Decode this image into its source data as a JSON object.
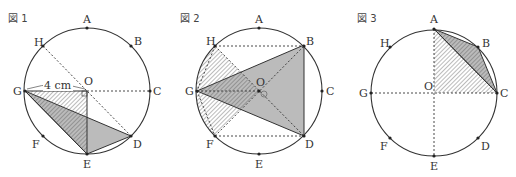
{
  "figures": [
    {
      "title": "図 1",
      "points": {
        "A": "A",
        "B": "B",
        "C": "C",
        "D": "D",
        "E": "E",
        "F": "F",
        "G": "G",
        "H": "H",
        "O": "O"
      },
      "measure": "4 cm"
    },
    {
      "title": "図 2",
      "points": {
        "A": "A",
        "B": "B",
        "C": "C",
        "D": "D",
        "E": "E",
        "F": "F",
        "G": "G",
        "H": "H",
        "O": "O"
      }
    },
    {
      "title": "図 3",
      "points": {
        "A": "A",
        "B": "B",
        "C": "C",
        "D": "D",
        "E": "E",
        "F": "F",
        "G": "G",
        "H": "H",
        "O": "O"
      }
    }
  ],
  "colors": {
    "stroke": "#333333",
    "shade": "#b8b8b8",
    "hatch": "#555555"
  }
}
